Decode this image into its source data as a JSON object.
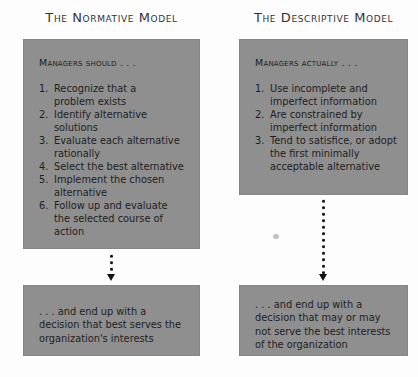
{
  "normative": {
    "title": "The Normative Model",
    "heading": "Managers should . . .",
    "steps": [
      {
        "num": "1.",
        "text": "Recognize that a problem exists"
      },
      {
        "num": "2.",
        "text": "Identify alternative solutions"
      },
      {
        "num": "3.",
        "text": "Evaluate each alternative rationally"
      },
      {
        "num": "4.",
        "text": "Select the best alternative"
      },
      {
        "num": "5.",
        "text": "Implement the chosen alternative"
      },
      {
        "num": "6.",
        "text": "Follow up and evaluate the selected course of action"
      }
    ],
    "outcome": ". . . and end up with a decision that best serves the organization's interests"
  },
  "descriptive": {
    "title": "The Descriptive Model",
    "heading": "Managers actually . . .",
    "steps": [
      {
        "num": "1.",
        "text": "Use incomplete and imperfect information"
      },
      {
        "num": "2.",
        "text": "Are constrained by imperfect information"
      },
      {
        "num": "3.",
        "text": "Tend to satisfice, or adopt the first minimally acceptable alternative"
      }
    ],
    "outcome": ". . . and end up with a decision that may or may not serve the best interests of the organization"
  },
  "colors": {
    "box_fill": "#8f8f8f",
    "text": "#1e1e1e",
    "arrow": "#111111",
    "background": "#fdfdfd"
  }
}
